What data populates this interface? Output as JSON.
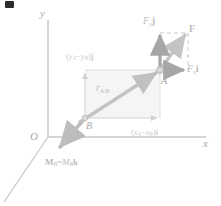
{
  "figure": {
    "background_color": "#ffffff"
  },
  "axes": {
    "origin_label": "O",
    "x_label": "x",
    "y_label": "y",
    "axis_color": "#c8c8c8",
    "origin": [
      48,
      137
    ],
    "x_axis_end": [
      208,
      137
    ],
    "y_axis_top": [
      48,
      18
    ],
    "z_axis_end": [
      4,
      200
    ]
  },
  "points": {
    "a": {
      "label": "A",
      "position": [
        160,
        70
      ]
    },
    "b": {
      "label": "B",
      "position": [
        85,
        118
      ]
    }
  },
  "vectors": {
    "force": {
      "label_main": "F",
      "label_y": "F",
      "label_y_sub": "y",
      "label_y_unit": "j",
      "label_x": "F",
      "label_x_sub": "x",
      "label_x_unit": "i",
      "tip": [
        188,
        30
      ],
      "color": "#c4c4c4",
      "component_color": "#a6a6a6"
    },
    "position": {
      "label_main": "r",
      "label_sub": "A/B",
      "color": "#c0c0c0"
    },
    "moment": {
      "label": "M",
      "label_sub_1": "B",
      "label_eq": "=",
      "label_mag": "M",
      "label_sub_2": "B",
      "label_unit": "k",
      "tip": [
        58,
        149
      ],
      "color": "#bdbdbd"
    }
  },
  "components": {
    "dy_open": "(",
    "dy_y1": "y",
    "dy_sub1": "A",
    "dy_minus": "−",
    "dy_y2": "y",
    "dy_sub2": "B",
    "dy_close": ")",
    "dy_unit": "j",
    "dx_open": "(",
    "dx_x1": "x",
    "dx_sub1": "A",
    "dx_minus": "−",
    "dx_x2": "x",
    "dx_sub2": "B",
    "dx_close": ")",
    "dx_unit": "i",
    "rect_fill": "#f4f4f4",
    "rect_stroke": "#dadada",
    "dash_stroke": "#c9c9c9"
  }
}
